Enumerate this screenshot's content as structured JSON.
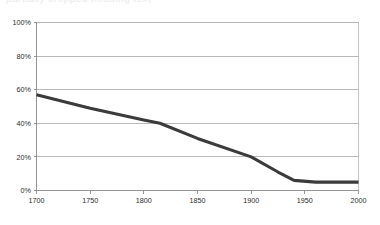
{
  "header": {
    "clipped_title": "partially cropped heading text"
  },
  "chart_data": {
    "type": "line",
    "title": "",
    "subtitle": "",
    "xlabel": "",
    "ylabel": "",
    "xlim": [
      1700,
      2000
    ],
    "ylim": [
      0,
      100
    ],
    "grid": true,
    "legend": "none",
    "x_tick_labels": [
      "1700",
      "1750",
      "1800",
      "1850",
      "1900",
      "1950",
      "2000"
    ],
    "x_ticks": [
      1700,
      1750,
      1800,
      1850,
      1900,
      1950,
      2000
    ],
    "y_tick_labels": [
      "0%",
      "20%",
      "40%",
      "60%",
      "80%",
      "100%"
    ],
    "y_ticks": [
      0,
      20,
      40,
      60,
      80,
      100
    ],
    "series": [
      {
        "name": "series-1",
        "color": "#3b3b3b",
        "x": [
          1700,
          1750,
          1800,
          1815,
          1850,
          1900,
          1925,
          1940,
          1960,
          1980,
          2000
        ],
        "values": [
          57,
          49,
          42,
          40,
          31,
          20,
          11,
          6,
          5,
          5,
          5
        ]
      }
    ]
  },
  "colors": {
    "line": "#3b3b3b",
    "grid": "#9a9a9a",
    "frame": "#b4b4b4",
    "text": "#2b2b2b",
    "background": "#ffffff"
  }
}
